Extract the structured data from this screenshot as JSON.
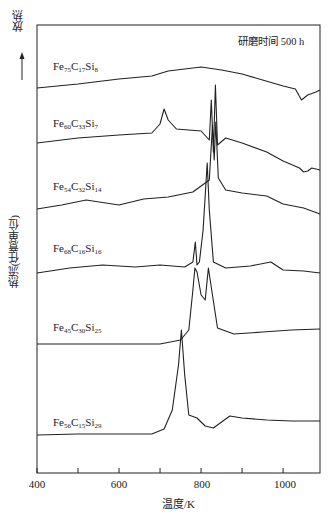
{
  "chart_data": {
    "type": "line",
    "title": "",
    "annotation": "研磨时间 500 h",
    "xlabel": "温度/K",
    "ylabel": "热流(任意单位)",
    "exo_label": "放热",
    "xlim": [
      400,
      1090
    ],
    "xticks": [
      400,
      600,
      800,
      1000
    ],
    "minor_xticks": [
      500,
      700,
      900
    ],
    "grid": false,
    "legend": "inline labels per curve",
    "series": [
      {
        "name": "Fe75C17Si8",
        "label": {
          "base": "Fe",
          "s1": "75",
          "c": "C",
          "s2": "17",
          "si": "Si",
          "s3": "8"
        },
        "x": [
          400,
          500,
          600,
          680,
          720,
          760,
          800,
          850,
          900,
          950,
          1000,
          1030,
          1045,
          1060,
          1080,
          1090
        ],
        "y": [
          88,
          84,
          79,
          76,
          71,
          69,
          67,
          70,
          74,
          80,
          86,
          89,
          100,
          95,
          92,
          90
        ]
      },
      {
        "name": "Fe60C33Si7",
        "label": {
          "base": "Fe",
          "s1": "60",
          "c": "C",
          "s2": "33",
          "si": "Si",
          "s3": "7"
        },
        "x": [
          400,
          500,
          600,
          680,
          700,
          710,
          720,
          740,
          800,
          820,
          825,
          830,
          835,
          840,
          860,
          900,
          960,
          1000,
          1040,
          1050,
          1060,
          1070,
          1090
        ],
        "y": [
          143,
          138,
          135,
          133,
          124,
          109,
          120,
          129,
          131,
          140,
          100,
          152,
          85,
          145,
          138,
          143,
          152,
          161,
          168,
          172,
          171,
          168,
          170
        ]
      },
      {
        "name": "Fe54C32Si14",
        "label": {
          "base": "Fe",
          "s1": "54",
          "c": "C",
          "s2": "32",
          "si": "Si",
          "s3": "14"
        },
        "x": [
          400,
          460,
          520,
          600,
          660,
          720,
          780,
          820,
          828,
          832,
          836,
          842,
          860,
          900,
          960,
          1000,
          1050,
          1090
        ],
        "y": [
          209,
          205,
          200,
          205,
          199,
          197,
          192,
          180,
          125,
          160,
          122,
          178,
          190,
          193,
          196,
          204,
          208,
          214
        ]
      },
      {
        "name": "Fe68C16Si16",
        "label": {
          "base": "Fe",
          "s1": "68",
          "c": "C",
          "s2": "16",
          "si": "Si",
          "s3": "16"
        },
        "x": [
          400,
          480,
          560,
          640,
          700,
          760,
          780,
          786,
          790,
          796,
          805,
          815,
          820,
          830,
          860,
          920,
          970,
          1000,
          1050,
          1090
        ],
        "y": [
          273,
          268,
          265,
          267,
          265,
          267,
          262,
          242,
          265,
          262,
          230,
          163,
          210,
          262,
          268,
          266,
          262,
          270,
          271,
          273
        ]
      },
      {
        "name": "Fe45C30Si25",
        "label": {
          "base": "Fe",
          "s1": "45",
          "c": "C",
          "s2": "30",
          "si": "Si",
          "s3": "25"
        },
        "x": [
          400,
          500,
          600,
          700,
          750,
          770,
          780,
          785,
          790,
          800,
          810,
          818,
          826,
          840,
          880,
          950,
          1020,
          1090
        ],
        "y": [
          344,
          344,
          344,
          344,
          340,
          330,
          290,
          268,
          272,
          295,
          300,
          268,
          290,
          328,
          334,
          332,
          330,
          329
        ]
      },
      {
        "name": "Fe56C15Si29",
        "label": {
          "base": "Fe",
          "s1": "56",
          "c": "C",
          "s2": "15",
          "si": "Si",
          "s3": "29"
        },
        "x": [
          400,
          500,
          600,
          680,
          710,
          730,
          745,
          752,
          760,
          770,
          790,
          810,
          830,
          850,
          870,
          900,
          960,
          1020,
          1090
        ],
        "y": [
          435,
          434,
          434,
          434,
          429,
          410,
          365,
          330,
          375,
          415,
          418,
          426,
          428,
          422,
          416,
          418,
          420,
          421,
          421
        ]
      }
    ],
    "y_units": "pixel offsets (arbitrary heat-flow units, curves vertically stacked)"
  },
  "axis": {
    "tick_labels": [
      "400",
      "600",
      "800",
      "1000"
    ]
  },
  "caption_fragment": "……研磨时间不同的Fe-C-Si系合金的DSC曲线"
}
